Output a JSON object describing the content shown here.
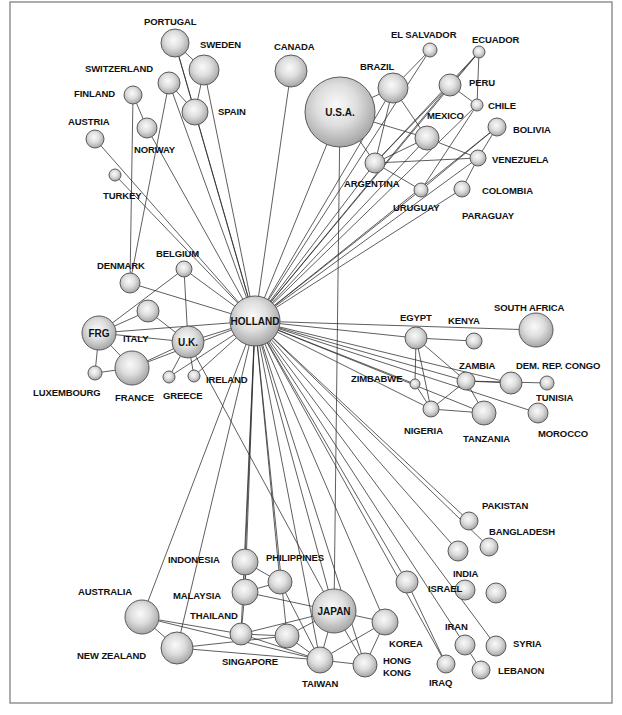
{
  "diagram": {
    "title": "",
    "hub": "HOLLAND",
    "frame": {
      "x": 10,
      "y": 2,
      "width": 602,
      "height": 701
    },
    "nodes": [
      {
        "id": "holland",
        "cx": 255,
        "cy": 321,
        "r": 25,
        "label": "HOLLAND",
        "label_inside": true,
        "fs": 10
      },
      {
        "id": "usa",
        "cx": 340,
        "cy": 112,
        "r": 35,
        "label": "U.S.A.",
        "label_inside": true,
        "fs": 10
      },
      {
        "id": "japan",
        "cx": 334,
        "cy": 611,
        "r": 22,
        "label": "JAPAN",
        "label_inside": true,
        "fs": 10
      },
      {
        "id": "frg",
        "cx": 99,
        "cy": 333,
        "r": 17,
        "label": "FRG",
        "label_inside": true,
        "fs": 10
      },
      {
        "id": "uk",
        "cx": 188,
        "cy": 342,
        "r": 16,
        "label": "U.K.",
        "label_inside": true,
        "fs": 10
      },
      {
        "id": "portugal",
        "cx": 175,
        "cy": 43,
        "r": 14,
        "label": "PORTUGAL",
        "lx": 144,
        "ly": 25
      },
      {
        "id": "sweden",
        "cx": 204,
        "cy": 70,
        "r": 15,
        "label": "SWEDEN",
        "lx": 200,
        "ly": 48
      },
      {
        "id": "switzerland",
        "cx": 169,
        "cy": 83,
        "r": 11,
        "label": "SWITZERLAND",
        "lx": 85,
        "ly": 72
      },
      {
        "id": "finland",
        "cx": 133,
        "cy": 95,
        "r": 9,
        "label": "FINLAND",
        "lx": 74,
        "ly": 97
      },
      {
        "id": "spain",
        "cx": 195,
        "cy": 112,
        "r": 13,
        "label": "SPAIN",
        "lx": 218,
        "ly": 115
      },
      {
        "id": "norway",
        "cx": 147,
        "cy": 128,
        "r": 10,
        "label": "NORWAY",
        "lx": 134,
        "ly": 153
      },
      {
        "id": "austria",
        "cx": 95,
        "cy": 139,
        "r": 9,
        "label": "AUSTRIA",
        "lx": 68,
        "ly": 125
      },
      {
        "id": "turkey",
        "cx": 115,
        "cy": 175,
        "r": 6,
        "label": "TURKEY",
        "lx": 103,
        "ly": 199
      },
      {
        "id": "canada",
        "cx": 291,
        "cy": 71,
        "r": 16,
        "label": "CANADA",
        "lx": 274,
        "ly": 50
      },
      {
        "id": "denmark",
        "cx": 130,
        "cy": 283,
        "r": 10,
        "label": "DENMARK",
        "lx": 97,
        "ly": 269
      },
      {
        "id": "belgium",
        "cx": 184,
        "cy": 269,
        "r": 8,
        "label": "BELGIUM",
        "lx": 156,
        "ly": 257
      },
      {
        "id": "italy",
        "cx": 148,
        "cy": 311,
        "r": 11,
        "label": "ITALY",
        "lx": 123,
        "ly": 342
      },
      {
        "id": "france",
        "cx": 132,
        "cy": 368,
        "r": 17,
        "label": "FRANCE",
        "lx": 115,
        "ly": 401
      },
      {
        "id": "luxembourg",
        "cx": 95,
        "cy": 373,
        "r": 7,
        "label": "LUXEMBOURG",
        "lx": 33,
        "ly": 396
      },
      {
        "id": "greece",
        "cx": 169,
        "cy": 377,
        "r": 6,
        "label": "GREECE",
        "lx": 163,
        "ly": 399
      },
      {
        "id": "ireland",
        "cx": 194,
        "cy": 376,
        "r": 6,
        "label": "IRELAND",
        "lx": 206,
        "ly": 383
      },
      {
        "id": "el_salvador",
        "cx": 430,
        "cy": 50,
        "r": 7,
        "label": "EL SALVADOR",
        "lx": 391,
        "ly": 38
      },
      {
        "id": "ecuador",
        "cx": 479,
        "cy": 52,
        "r": 6,
        "label": "ECUADOR",
        "lx": 472,
        "ly": 43
      },
      {
        "id": "brazil",
        "cx": 393,
        "cy": 88,
        "r": 15,
        "label": "BRAZIL",
        "lx": 360,
        "ly": 70
      },
      {
        "id": "peru_node",
        "cx": 450,
        "cy": 85,
        "r": 11,
        "label": "PERU",
        "lx": 469,
        "ly": 86
      },
      {
        "id": "chile",
        "cx": 477,
        "cy": 105,
        "r": 6,
        "label": "CHILE",
        "lx": 488,
        "ly": 109
      },
      {
        "id": "mexico",
        "cx": 427,
        "cy": 138,
        "r": 12,
        "label": "MEXICO",
        "lx": 427,
        "ly": 119
      },
      {
        "id": "bolivia",
        "cx": 497,
        "cy": 127,
        "r": 9,
        "label": "BOLIVIA",
        "lx": 513,
        "ly": 133
      },
      {
        "id": "venezuela",
        "cx": 478,
        "cy": 158,
        "r": 8,
        "label": "VENEZUELA",
        "lx": 492,
        "ly": 163
      },
      {
        "id": "argentina",
        "cx": 375,
        "cy": 163,
        "r": 10,
        "label": "ARGENTINA",
        "lx": 344,
        "ly": 187
      },
      {
        "id": "uruguay",
        "cx": 421,
        "cy": 190,
        "r": 7,
        "label": "URUGUAY",
        "lx": 393,
        "ly": 211
      },
      {
        "id": "colombia",
        "cx": 462,
        "cy": 189,
        "r": 8,
        "label": "COLOMBIA",
        "lx": 482,
        "ly": 194
      },
      {
        "id": "paraguay",
        "cx": 0,
        "cy": 0,
        "r": 0,
        "label": "PARAGUAY",
        "lx": 462,
        "ly": 219,
        "label_only": true
      },
      {
        "id": "egypt",
        "cx": 416,
        "cy": 338,
        "r": 11,
        "label": "EGYPT",
        "lx": 400,
        "ly": 321
      },
      {
        "id": "kenya",
        "cx": 474,
        "cy": 341,
        "r": 8,
        "label": "KENYA",
        "lx": 448,
        "ly": 324
      },
      {
        "id": "south_africa",
        "cx": 536,
        "cy": 330,
        "r": 17,
        "label": "SOUTH AFRICA",
        "lx": 494,
        "ly": 311
      },
      {
        "id": "zambia",
        "cx": 466,
        "cy": 381,
        "r": 9,
        "label": "ZAMBIA",
        "lx": 459,
        "ly": 369
      },
      {
        "id": "zambia_east",
        "cx": 511,
        "cy": 383,
        "r": 11,
        "label": "",
        "lx": 0,
        "ly": 0
      },
      {
        "id": "dem_rep_congo",
        "cx": 547,
        "cy": 383,
        "r": 7,
        "label": "DEM. REP. CONGO",
        "lx": 516,
        "ly": 369
      },
      {
        "id": "zimbabwe",
        "cx": 415,
        "cy": 384,
        "r": 5,
        "label": "ZIMBABWE",
        "lx": 351,
        "ly": 382
      },
      {
        "id": "tunisia",
        "cx": 0,
        "cy": 0,
        "r": 0,
        "label": "TUNISIA",
        "lx": 536,
        "ly": 401,
        "label_only": true
      },
      {
        "id": "nigeria",
        "cx": 431,
        "cy": 409,
        "r": 8,
        "label": "NIGERIA",
        "lx": 404,
        "ly": 434
      },
      {
        "id": "tanzania",
        "cx": 484,
        "cy": 413,
        "r": 12,
        "label": "TANZANIA",
        "lx": 463,
        "ly": 442
      },
      {
        "id": "morocco",
        "cx": 538,
        "cy": 413,
        "r": 10,
        "label": "MOROCCO",
        "lx": 538,
        "ly": 437
      },
      {
        "id": "pakistan",
        "cx": 469,
        "cy": 521,
        "r": 9,
        "label": "PAKISTAN",
        "lx": 482,
        "ly": 509
      },
      {
        "id": "bangladesh",
        "cx": 489,
        "cy": 547,
        "r": 9,
        "label": "BANGLADESH",
        "lx": 489,
        "ly": 535
      },
      {
        "id": "india",
        "cx": 458,
        "cy": 551,
        "r": 10,
        "label": "INDIA",
        "lx": 453,
        "ly": 577
      },
      {
        "id": "israel",
        "cx": 407,
        "cy": 582,
        "r": 11,
        "label": "ISRAEL",
        "lx": 428,
        "ly": 592
      },
      {
        "id": "iran",
        "cx": 465,
        "cy": 590,
        "r": 10,
        "label": "IRAN",
        "lx": 445,
        "ly": 630
      },
      {
        "id": "syria",
        "cx": 496,
        "cy": 593,
        "r": 10,
        "label": "SYRIA",
        "lx": 513,
        "ly": 647
      },
      {
        "id": "iraq",
        "cx": 446,
        "cy": 664,
        "r": 9,
        "label": "IRAQ",
        "lx": 429,
        "ly": 686
      },
      {
        "id": "lebanon",
        "cx": 481,
        "cy": 670,
        "r": 9,
        "label": "LEBANON",
        "lx": 498,
        "ly": 674
      },
      {
        "id": "iran_node",
        "cx": 465,
        "cy": 645,
        "r": 10,
        "label": "",
        "lx": 0,
        "ly": 0
      },
      {
        "id": "syria_node",
        "cx": 496,
        "cy": 646,
        "r": 10,
        "label": "",
        "lx": 0,
        "ly": 0
      },
      {
        "id": "indonesia_node",
        "cx": 245,
        "cy": 562,
        "r": 13,
        "label": "INDONESIA",
        "lx": 168,
        "ly": 563
      },
      {
        "id": "philippines",
        "cx": 280,
        "cy": 582,
        "r": 12,
        "label": "PHILIPPINES",
        "lx": 266,
        "ly": 561
      },
      {
        "id": "malaysia",
        "cx": 245,
        "cy": 592,
        "r": 13,
        "label": "MALAYSIA",
        "lx": 173,
        "ly": 599
      },
      {
        "id": "thailand",
        "cx": 241,
        "cy": 634,
        "r": 11,
        "label": "THAILAND",
        "lx": 190,
        "ly": 619
      },
      {
        "id": "singapore",
        "cx": 287,
        "cy": 636,
        "r": 12,
        "label": "SINGAPORE",
        "lx": 222,
        "ly": 665
      },
      {
        "id": "australia",
        "cx": 142,
        "cy": 617,
        "r": 17,
        "label": "AUSTRALIA",
        "lx": 78,
        "ly": 595
      },
      {
        "id": "new_zealand",
        "cx": 177,
        "cy": 648,
        "r": 16,
        "label": "NEW ZEALAND",
        "lx": 77,
        "ly": 659
      },
      {
        "id": "korea",
        "cx": 385,
        "cy": 622,
        "r": 13,
        "label": "KOREA",
        "lx": 389,
        "ly": 647
      },
      {
        "id": "taiwan",
        "cx": 320,
        "cy": 660,
        "r": 13,
        "label": "TAIWAN",
        "lx": 302,
        "ly": 687
      },
      {
        "id": "hong_kong",
        "cx": 365,
        "cy": 665,
        "r": 12,
        "label": "HONG",
        "label2": "KONG",
        "lx": 383,
        "ly": 664
      }
    ],
    "edges": [
      [
        "holland",
        "portugal"
      ],
      [
        "holland",
        "sweden"
      ],
      [
        "holland",
        "spain"
      ],
      [
        "holland",
        "switzerland"
      ],
      [
        "holland",
        "norway"
      ],
      [
        "holland",
        "austria"
      ],
      [
        "holland",
        "turkey"
      ],
      [
        "holland",
        "canada"
      ],
      [
        "holland",
        "usa"
      ],
      [
        "holland",
        "brazil"
      ],
      [
        "holland",
        "argentina"
      ],
      [
        "holland",
        "mexico"
      ],
      [
        "holland",
        "peru_node"
      ],
      [
        "holland",
        "uruguay"
      ],
      [
        "holland",
        "venezuela"
      ],
      [
        "holland",
        "colombia"
      ],
      [
        "holland",
        "bolivia"
      ],
      [
        "holland",
        "chile"
      ],
      [
        "holland",
        "el_salvador"
      ],
      [
        "holland",
        "ecuador"
      ],
      [
        "holland",
        "belgium"
      ],
      [
        "holland",
        "denmark"
      ],
      [
        "holland",
        "frg"
      ],
      [
        "holland",
        "uk"
      ],
      [
        "holland",
        "france"
      ],
      [
        "holland",
        "greece"
      ],
      [
        "holland",
        "ireland"
      ],
      [
        "holland",
        "south_africa"
      ],
      [
        "holland",
        "egypt"
      ],
      [
        "holland",
        "zambia"
      ],
      [
        "holland",
        "zambia_east"
      ],
      [
        "holland",
        "zimbabwe"
      ],
      [
        "holland",
        "nigeria"
      ],
      [
        "holland",
        "tanzania"
      ],
      [
        "holland",
        "morocco"
      ],
      [
        "holland",
        "pakistan"
      ],
      [
        "holland",
        "bangladesh"
      ],
      [
        "holland",
        "india"
      ],
      [
        "holland",
        "israel"
      ],
      [
        "holland",
        "iran_node"
      ],
      [
        "holland",
        "syria_node"
      ],
      [
        "holland",
        "iraq"
      ],
      [
        "holland",
        "japan"
      ],
      [
        "holland",
        "korea"
      ],
      [
        "holland",
        "taiwan"
      ],
      [
        "holland",
        "hong_kong"
      ],
      [
        "holland",
        "indonesia_node"
      ],
      [
        "holland",
        "philippines"
      ],
      [
        "holland",
        "malaysia"
      ],
      [
        "holland",
        "thailand"
      ],
      [
        "holland",
        "singapore"
      ],
      [
        "holland",
        "australia"
      ],
      [
        "holland",
        "new_zealand"
      ],
      [
        "portugal",
        "sweden"
      ],
      [
        "portugal",
        "spain"
      ],
      [
        "sweden",
        "spain"
      ],
      [
        "switzerland",
        "spain"
      ],
      [
        "finland",
        "norway"
      ],
      [
        "finland",
        "denmark"
      ],
      [
        "switzerland",
        "denmark"
      ],
      [
        "usa",
        "brazil"
      ],
      [
        "usa",
        "mexico"
      ],
      [
        "usa",
        "argentina"
      ],
      [
        "usa",
        "japan"
      ],
      [
        "brazil",
        "el_salvador"
      ],
      [
        "brazil",
        "mexico"
      ],
      [
        "brazil",
        "argentina"
      ],
      [
        "peru_node",
        "ecuador"
      ],
      [
        "peru_node",
        "chile"
      ],
      [
        "peru_node",
        "argentina"
      ],
      [
        "ecuador",
        "chile"
      ],
      [
        "ecuador",
        "argentina"
      ],
      [
        "mexico",
        "argentina"
      ],
      [
        "mexico",
        "venezuela"
      ],
      [
        "argentina",
        "venezuela"
      ],
      [
        "argentina",
        "uruguay"
      ],
      [
        "uruguay",
        "bolivia"
      ],
      [
        "venezuela",
        "bolivia"
      ],
      [
        "venezuela",
        "colombia"
      ],
      [
        "chile",
        "uruguay"
      ],
      [
        "belgium",
        "frg"
      ],
      [
        "belgium",
        "uk"
      ],
      [
        "frg",
        "italy"
      ],
      [
        "frg",
        "france"
      ],
      [
        "frg",
        "uk"
      ],
      [
        "italy",
        "uk"
      ],
      [
        "france",
        "uk"
      ],
      [
        "luxembourg",
        "france"
      ],
      [
        "greece",
        "uk"
      ],
      [
        "ireland",
        "uk"
      ],
      [
        "uk",
        "japan"
      ],
      [
        "luxembourg",
        "frg"
      ],
      [
        "egypt",
        "kenya"
      ],
      [
        "egypt",
        "zambia"
      ],
      [
        "egypt",
        "zimbabwe"
      ],
      [
        "egypt",
        "nigeria"
      ],
      [
        "zambia",
        "zambia_east"
      ],
      [
        "zambia",
        "nigeria"
      ],
      [
        "zambia",
        "tanzania"
      ],
      [
        "zambia",
        "dem_rep_congo"
      ],
      [
        "zimbabwe",
        "nigeria"
      ],
      [
        "nigeria",
        "tanzania"
      ],
      [
        "iran_node",
        "lebanon"
      ],
      [
        "israel",
        "iraq"
      ],
      [
        "indonesia_node",
        "malaysia"
      ],
      [
        "indonesia_node",
        "philippines"
      ],
      [
        "malaysia",
        "philippines"
      ],
      [
        "malaysia",
        "thailand"
      ],
      [
        "malaysia",
        "japan"
      ],
      [
        "thailand",
        "singapore"
      ],
      [
        "thailand",
        "japan"
      ],
      [
        "thailand",
        "taiwan"
      ],
      [
        "australia",
        "new_zealand"
      ],
      [
        "australia",
        "thailand"
      ],
      [
        "australia",
        "taiwan"
      ],
      [
        "new_zealand",
        "singapore"
      ],
      [
        "new_zealand",
        "taiwan"
      ],
      [
        "singapore",
        "japan"
      ],
      [
        "singapore",
        "taiwan"
      ],
      [
        "japan",
        "korea"
      ],
      [
        "japan",
        "taiwan"
      ],
      [
        "japan",
        "hong_kong"
      ],
      [
        "korea",
        "taiwan"
      ],
      [
        "korea",
        "hong_kong"
      ],
      [
        "taiwan",
        "hong_kong"
      ],
      [
        "philippines",
        "taiwan"
      ]
    ]
  }
}
